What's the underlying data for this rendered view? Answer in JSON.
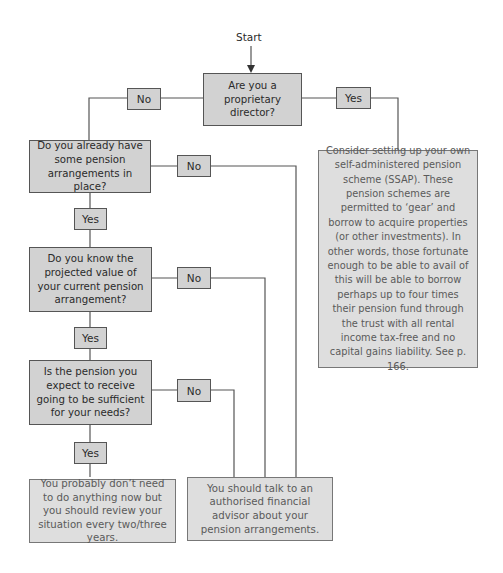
{
  "start": "Start",
  "questions": [
    "Are you a proprietary director?",
    "Do you already have some pension arrangements in place?",
    "Do you know the projected value of your current pension arrangement?",
    "Is the pension you expect to receive going to be sufficient for your needs?"
  ],
  "labels": {
    "q1_no": "No",
    "q1_yes": "Yes",
    "q2_no": "No",
    "q2_yes": "Yes",
    "q3_no": "No",
    "q3_yes": "Yes",
    "q4_no": "No",
    "q4_yes": "Yes"
  },
  "outcomes": {
    "ssap": "Consider setting up your own self-administered pension scheme (SSAP). These pension schemes are permitted to ‘gear’ and borrow to acquire properties (or other investments). In other words, those fortunate enough to be able to avail of this will be able to borrow perhaps up to four times their pension fund through the trust with all rental income tax-free and no capital gains liability. See p. 166.",
    "no_action": "You probably don’t need to do anything now but you should review your situation every two/three years.",
    "advisor": "You should talk to an authorised financial advisor about your pension arrangements."
  },
  "colors": {
    "box_fill": "#d2d2d2",
    "outcome_fill": "#dedede",
    "line": "#555555"
  }
}
